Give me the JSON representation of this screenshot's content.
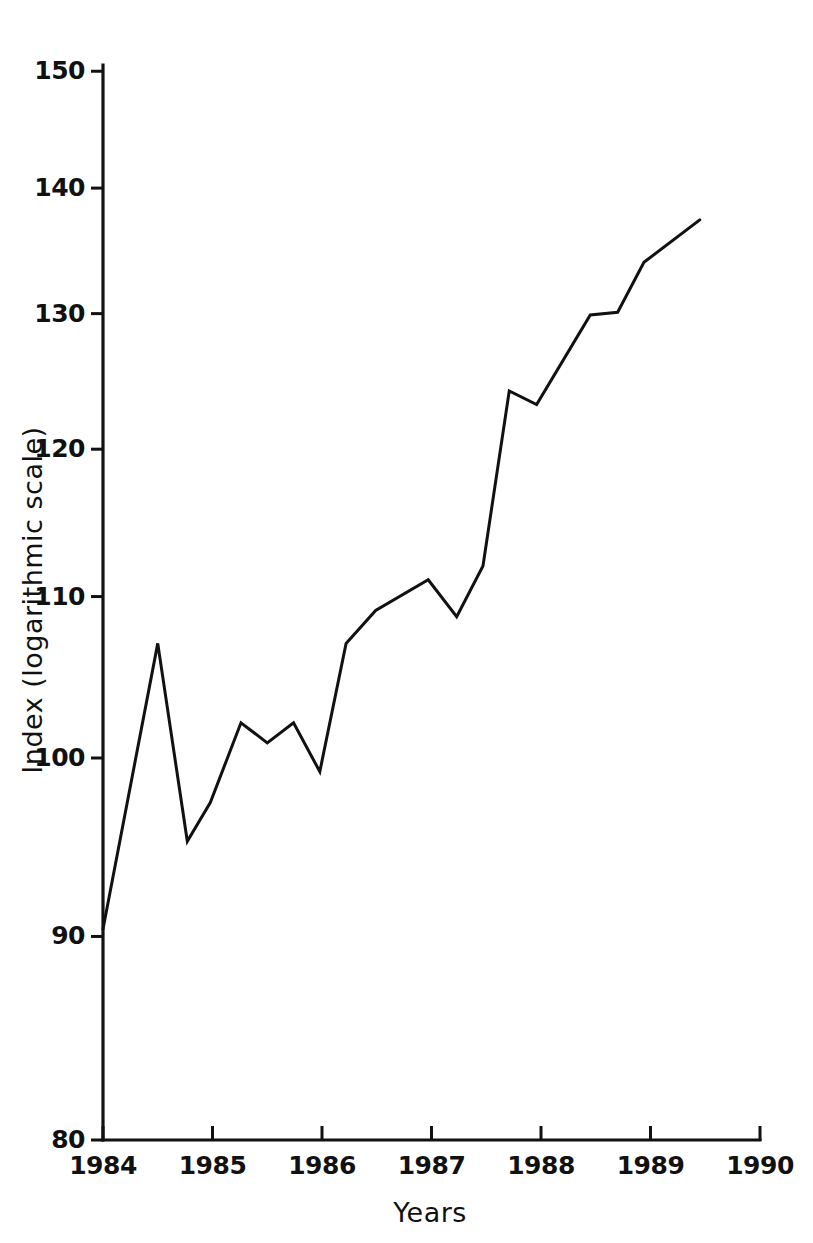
{
  "chart_data": {
    "type": "line",
    "title": "",
    "subtitle": "",
    "xlabel": "Years",
    "ylabel": "Index (logarithmic scale)",
    "yscale": "log",
    "xlim": [
      1984,
      1990
    ],
    "ylim": [
      80,
      150
    ],
    "grid": false,
    "legend": null,
    "xticks": [
      "1984",
      "1985",
      "1986",
      "1987",
      "1988",
      "1989",
      "1990"
    ],
    "xtick_values": [
      1984,
      1985,
      1986,
      1987,
      1988,
      1989,
      1990
    ],
    "yticks": [
      "150",
      "140",
      "130",
      "120",
      "110",
      "100",
      "90",
      "80"
    ],
    "ytick_values": [
      150,
      140,
      130,
      120,
      110,
      100,
      90,
      80
    ],
    "line_color": "#111111",
    "series": [
      {
        "name": "Index",
        "x": [
          1984.0,
          1984.5,
          1984.77,
          1984.98,
          1985.26,
          1985.5,
          1985.74,
          1985.98,
          1986.22,
          1986.49,
          1986.97,
          1987.23,
          1987.47,
          1987.71,
          1987.96,
          1988.45,
          1988.7,
          1988.94,
          1989.45
        ],
        "values": [
          90.4,
          107.0,
          95.2,
          97.4,
          102.1,
          100.9,
          102.1,
          99.2,
          107.0,
          109.1,
          111.1,
          108.7,
          112.0,
          124.2,
          123.2,
          129.9,
          130.1,
          134.0,
          137.4
        ]
      }
    ],
    "annotations": []
  },
  "figure": {
    "background_color": "#ffffff",
    "axis_color": "#111111"
  }
}
